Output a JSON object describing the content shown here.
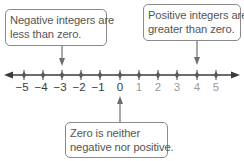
{
  "colors": {
    "line": "#3a3a3a",
    "tick_marker": "#5a5a5a",
    "negative_label": "#3a3a3a",
    "zero_label": "#3a3a3a",
    "positive_label": "#9a9a9a",
    "callout_border": "#8a8a8a",
    "callout_text": "#555555",
    "arrow": "#6e6e6e"
  },
  "callouts": {
    "negative": {
      "line1": "Negative integers are",
      "line2": "less than zero.",
      "points_to": -3
    },
    "positive": {
      "line1": "Positive integers are",
      "line2": "greater than zero.",
      "points_to": 4
    },
    "zero": {
      "line1": "Zero is neither",
      "line2": "negative nor positive.",
      "points_to": 0
    }
  },
  "number_line": {
    "min": -5,
    "max": 5,
    "arrows": [
      "left",
      "right"
    ],
    "ticks": [
      {
        "value": -5,
        "label": "−5",
        "x": 24
      },
      {
        "value": -4,
        "label": "−4",
        "x": 43
      },
      {
        "value": -3,
        "label": "−3",
        "x": 62
      },
      {
        "value": -2,
        "label": "−2",
        "x": 81
      },
      {
        "value": -1,
        "label": "−1",
        "x": 100
      },
      {
        "value": 0,
        "label": "0",
        "x": 120
      },
      {
        "value": 1,
        "label": "1",
        "x": 139
      },
      {
        "value": 2,
        "label": "2",
        "x": 158
      },
      {
        "value": 3,
        "label": "3",
        "x": 177
      },
      {
        "value": 4,
        "label": "4",
        "x": 197
      },
      {
        "value": 5,
        "label": "5",
        "x": 216
      }
    ]
  }
}
